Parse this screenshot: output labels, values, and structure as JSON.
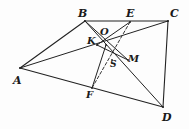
{
  "figure": {
    "type": "geometry-diagram",
    "canvas": {
      "width": 189,
      "height": 129
    },
    "stroke_color": "#222222",
    "dash_color": "#333333",
    "background": "#fdfdfd",
    "points": [
      {
        "id": "A",
        "label": "A",
        "x": 20,
        "y": 68,
        "label_x": 13,
        "label_y": 75,
        "size": "lg"
      },
      {
        "id": "B",
        "label": "B",
        "x": 85,
        "y": 21,
        "label_x": 78,
        "label_y": 8,
        "size": "lg"
      },
      {
        "id": "E",
        "label": "E",
        "x": 130,
        "y": 22,
        "label_x": 126,
        "label_y": 8,
        "size": "lg"
      },
      {
        "id": "C",
        "label": "C",
        "x": 168,
        "y": 21,
        "label_x": 170,
        "label_y": 8,
        "size": "lg"
      },
      {
        "id": "D",
        "label": "D",
        "x": 163,
        "y": 107,
        "label_x": 162,
        "label_y": 112,
        "size": "lg"
      },
      {
        "id": "F",
        "label": "F",
        "x": 92,
        "y": 88,
        "label_x": 86,
        "label_y": 90,
        "size": "md"
      },
      {
        "id": "O",
        "label": "O",
        "x": 106,
        "y": 45,
        "label_x": 100,
        "label_y": 27,
        "size": "md"
      },
      {
        "id": "K",
        "label": "K",
        "x": 97,
        "y": 45,
        "label_x": 87,
        "label_y": 36,
        "size": "md"
      },
      {
        "id": "S",
        "label": "S",
        "x": 112,
        "y": 60,
        "label_x": 110,
        "label_y": 60,
        "size": "sm"
      },
      {
        "id": "M",
        "label": "M",
        "x": 128,
        "y": 60,
        "label_x": 128,
        "label_y": 54,
        "size": "md"
      }
    ],
    "segments": [
      {
        "name": "AB",
        "from": "A",
        "to": "B",
        "style": "solid",
        "width": 1.1
      },
      {
        "name": "BC",
        "from": "B",
        "to": "C",
        "style": "solid",
        "width": 1.1
      },
      {
        "name": "CD",
        "from": "C",
        "to": "D",
        "style": "solid",
        "width": 1.1
      },
      {
        "name": "AD",
        "from": "A",
        "to": "D",
        "style": "solid",
        "width": 1.1
      },
      {
        "name": "AC",
        "from": "A",
        "to": "C",
        "style": "solid",
        "width": 1.0
      },
      {
        "name": "BD",
        "from": "B",
        "to": "D",
        "style": "solid",
        "width": 1.0
      },
      {
        "name": "BM-D",
        "from": "B",
        "to": "M",
        "style": "solid",
        "width": 1.0
      },
      {
        "name": "OF",
        "from": "O",
        "to": "F",
        "style": "solid",
        "width": 1.0
      },
      {
        "name": "KM",
        "from": "K",
        "to": "M",
        "style": "solid",
        "width": 1.0
      },
      {
        "name": "EF",
        "from": "E",
        "to": "F",
        "style": "dashed",
        "width": 1.0
      },
      {
        "name": "EK",
        "from": "E",
        "to": "K",
        "style": "solid",
        "width": 1.0
      }
    ]
  }
}
